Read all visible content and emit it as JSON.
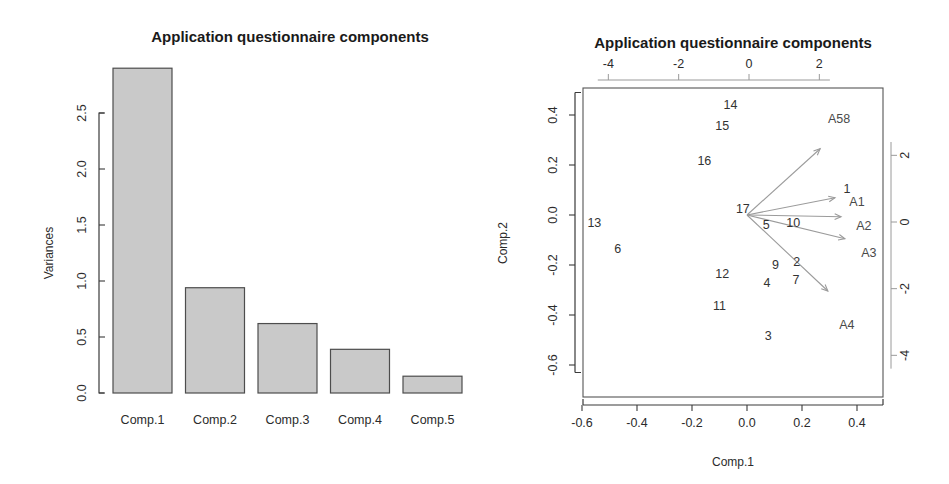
{
  "figure": {
    "panels": [
      "scree-plot",
      "biplot"
    ]
  },
  "scree": {
    "title": "Application questionnaire components",
    "ylabel": "Variances",
    "y_ticks": [
      "0.0",
      "0.5",
      "1.0",
      "1.5",
      "2.0",
      "2.5"
    ],
    "categories": [
      "Comp.1",
      "Comp.2",
      "Comp.3",
      "Comp.4",
      "Comp.5"
    ]
  },
  "biplot": {
    "title": "Application questionnaire components",
    "xlabel": "Comp.1",
    "ylabel": "Comp.2",
    "bottom_ticks": [
      "-0.6",
      "-0.4",
      "-0.2",
      "0.0",
      "0.2",
      "0.4"
    ],
    "left_ticks": [
      "0.4",
      "0.2",
      "0.0",
      "-0.2",
      "-0.4",
      "-0.6"
    ],
    "top_ticks": [
      "-4",
      "-2",
      "0",
      "2"
    ],
    "right_ticks": [
      "2",
      "0",
      "-2",
      "-4"
    ],
    "observation_labels": [
      "14",
      "15",
      "16",
      "17",
      "13",
      "6",
      "12",
      "11",
      "5",
      "10",
      "9",
      "2",
      "4",
      "7",
      "3",
      "1"
    ],
    "variable_labels": [
      "A58",
      "A1",
      "A2",
      "A3",
      "A4"
    ]
  },
  "chart_data": [
    {
      "type": "bar",
      "title": "Application questionnaire components",
      "xlabel": "",
      "ylabel": "Variances",
      "categories": [
        "Comp.1",
        "Comp.2",
        "Comp.3",
        "Comp.4",
        "Comp.5"
      ],
      "values": [
        2.9,
        0.94,
        0.62,
        0.39,
        0.15
      ],
      "ylim": [
        0.0,
        2.9
      ],
      "yticks": [
        0.0,
        0.5,
        1.0,
        1.5,
        2.0,
        2.5
      ],
      "grid": false,
      "legend": "none",
      "bar_fill": "#c9c9c9",
      "bar_stroke": "#4d4d4d"
    },
    {
      "type": "scatter",
      "title": "Application questionnaire components",
      "xlabel": "Comp.1",
      "ylabel": "Comp.2",
      "xlim": [
        -0.68,
        0.5
      ],
      "ylim": [
        -0.65,
        0.49
      ],
      "xticks": [
        -0.6,
        -0.4,
        -0.2,
        0.0,
        0.2,
        0.4
      ],
      "yticks": [
        -0.6,
        -0.4,
        -0.2,
        0.0,
        0.2,
        0.4
      ],
      "secondary_xlim": [
        -5.3,
        3.5
      ],
      "secondary_ylim": [
        -5.2,
        3.8
      ],
      "secondary_xticks": [
        -4,
        -2,
        0,
        2
      ],
      "secondary_yticks": [
        -4,
        -2,
        0,
        2
      ],
      "grid": false,
      "legend": "none",
      "point_labels": [
        {
          "label": "14",
          "x": -0.06,
          "y": 0.445
        },
        {
          "label": "15",
          "x": -0.09,
          "y": 0.36
        },
        {
          "label": "16",
          "x": -0.155,
          "y": 0.22
        },
        {
          "label": "17",
          "x": -0.015,
          "y": 0.027
        },
        {
          "label": "13",
          "x": -0.555,
          "y": -0.027
        },
        {
          "label": "6",
          "x": -0.47,
          "y": -0.13
        },
        {
          "label": "12",
          "x": -0.09,
          "y": -0.23
        },
        {
          "label": "11",
          "x": -0.1,
          "y": -0.36
        },
        {
          "label": "5",
          "x": 0.07,
          "y": -0.036
        },
        {
          "label": "10",
          "x": 0.168,
          "y": -0.028
        },
        {
          "label": "9",
          "x": 0.104,
          "y": -0.196
        },
        {
          "label": "2",
          "x": 0.181,
          "y": -0.184
        },
        {
          "label": "4",
          "x": 0.073,
          "y": -0.269
        },
        {
          "label": "7",
          "x": 0.178,
          "y": -0.254
        },
        {
          "label": "3",
          "x": 0.077,
          "y": -0.478
        },
        {
          "label": "1",
          "x": 0.364,
          "y": 0.109
        }
      ],
      "vectors": [
        {
          "label": "A58",
          "tip_x": 0.266,
          "tip_y": 0.265,
          "label_x": 0.335,
          "label_y": 0.39
        },
        {
          "label": "A1",
          "tip_x": 0.32,
          "tip_y": 0.069,
          "label_x": 0.4,
          "label_y": 0.055
        },
        {
          "label": "A2",
          "tip_x": 0.342,
          "tip_y": -0.007,
          "label_x": 0.425,
          "label_y": -0.038
        },
        {
          "label": "A3",
          "tip_x": 0.356,
          "tip_y": -0.095,
          "label_x": 0.443,
          "label_y": -0.147
        },
        {
          "label": "A4",
          "tip_x": 0.294,
          "tip_y": -0.304,
          "label_x": 0.363,
          "label_y": -0.434
        }
      ],
      "vector_origin": {
        "x": 0.0,
        "y": 0.0
      }
    }
  ]
}
